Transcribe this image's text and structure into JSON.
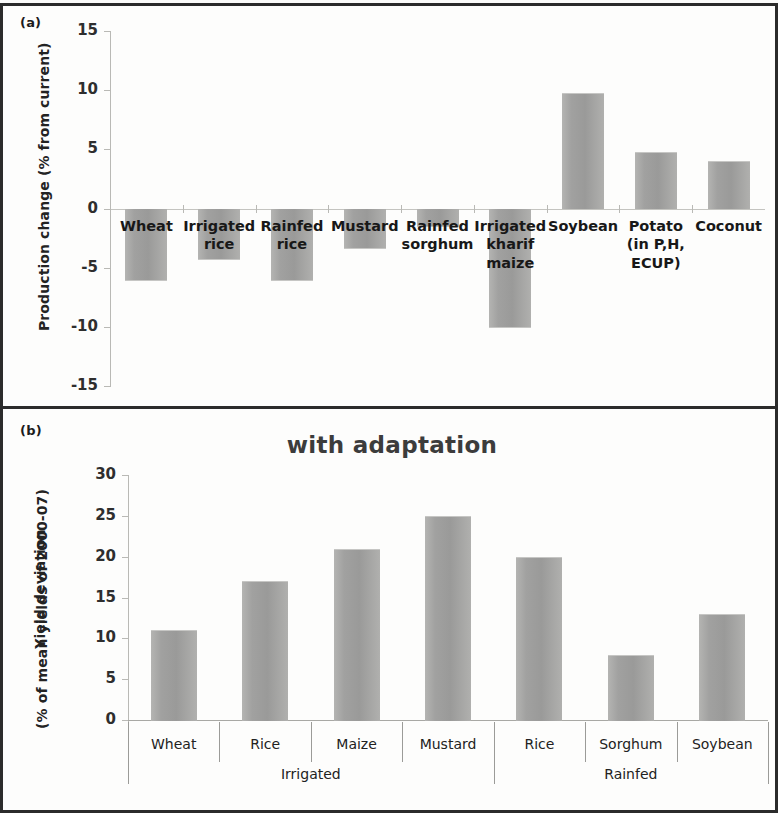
{
  "figure": {
    "panel_a_tag": "(a)",
    "panel_b_tag": "(b)"
  },
  "chart_data": [
    {
      "type": "bar",
      "panel": "(a)",
      "title": "",
      "xlabel": "",
      "ylabel": "Production change (% from current)",
      "ylim": [
        -15,
        15
      ],
      "yticks": [
        15,
        10,
        5,
        0,
        -5,
        -10,
        -15
      ],
      "ytick_labels": [
        "15",
        "10",
        "5",
        "0",
        "-5",
        "-10",
        "-15"
      ],
      "grid": true,
      "legend": "none",
      "categories": [
        "Wheat",
        "Irrigated\nrice",
        "Rainfed\nrice",
        "Mustard",
        "Rainfed\nsorghum",
        "Irrigated\nkharif\nmaize",
        "Soybean",
        "Potato\n(in P,H,\nECUP)",
        "Coconut"
      ],
      "values": [
        -6.0,
        -4.3,
        -6.0,
        -3.3,
        -1.5,
        -10.0,
        9.8,
        4.8,
        4.0
      ]
    },
    {
      "type": "bar",
      "panel": "(b)",
      "title": "with adaptation",
      "xlabel": "",
      "ylabel_line1": "Yield deviation",
      "ylabel_line2": "(% of mean yields of 2000-07)",
      "ylim": [
        0,
        30
      ],
      "yticks": [
        30,
        25,
        20,
        15,
        10,
        5,
        0
      ],
      "ytick_labels": [
        "30",
        "25",
        "20",
        "15",
        "10",
        "5",
        "0"
      ],
      "grid": false,
      "legend": "none",
      "categories": [
        "Wheat",
        "Rice",
        "Maize",
        "Mustard",
        "Rice",
        "Sorghum",
        "Soybean"
      ],
      "values": [
        11.0,
        17.0,
        21.0,
        25.0,
        20.0,
        8.0,
        13.0
      ],
      "groups": [
        {
          "label": "Irrigated",
          "members": [
            "Wheat",
            "Rice",
            "Maize",
            "Mustard"
          ]
        },
        {
          "label": "Rainfed",
          "members": [
            "Rice",
            "Sorghum",
            "Soybean"
          ]
        }
      ]
    }
  ],
  "colors": {
    "bar_fill": "#9a9a99",
    "axis": "#b9b9b5",
    "frame": "#2b2b2b",
    "text": "#232323",
    "title": "#3c3c3c"
  }
}
